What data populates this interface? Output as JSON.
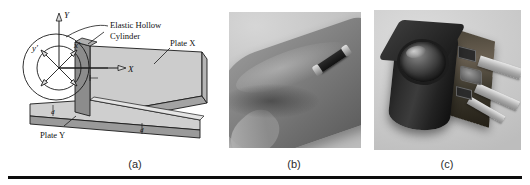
{
  "figure": {
    "panels": [
      {
        "id": "a",
        "caption": "(a)",
        "type": "line-diagram",
        "labels": {
          "elastic_hollow_cylinder_line1": "Elastic Hollow",
          "elastic_hollow_cylinder_line2": "Cylinder",
          "plate_x": "Plate X",
          "plate_y": "Plate Y",
          "axis_Y": "Y",
          "axis_X": "X",
          "axis_x_prime": "x'",
          "axis_y_prime": "y'",
          "dim_plate_y": "d",
          "dim_plate_x": "d"
        }
      },
      {
        "id": "b",
        "caption": "(b)",
        "type": "photograph",
        "alt": "Fingertip with miniature cylindrical sensor mounted on the nail side"
      },
      {
        "id": "c",
        "caption": "(c)",
        "type": "photograph",
        "alt": "Black cylindrical lens module attached to a circuit board with ribbon cables"
      }
    ]
  },
  "colors": {
    "plate_fill": "#c9c9c9",
    "plate_fill_dark": "#9d9d9d",
    "cylinder_fill": "#8a8a8a",
    "stroke": "#1a1a1a",
    "rule": "#0c0c0c",
    "photo_bg_b": "#c9c9c9",
    "photo_bg_c": "#d2d2d2"
  }
}
